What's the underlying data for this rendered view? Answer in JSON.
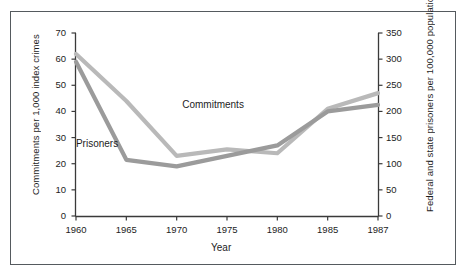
{
  "figure": {
    "background": "#ffffff",
    "frame_color": "#555a5e"
  },
  "chart_data": {
    "type": "line",
    "title": "",
    "xlabel": "Year",
    "ylabel": "Commitments per 1,000 index crimes",
    "y2label": "Federal and state prisoners per 100,000 population",
    "x": [
      1960,
      1965,
      1970,
      1975,
      1980,
      1985,
      1987
    ],
    "xtick_labels": [
      "1960",
      "1965",
      "1970",
      "1975",
      "1980",
      "1985",
      "1987"
    ],
    "ylim": [
      0,
      70
    ],
    "ytick_labels": [
      "0",
      "10",
      "20",
      "30",
      "40",
      "50",
      "60",
      "70"
    ],
    "ytick_values": [
      0,
      10,
      20,
      30,
      40,
      50,
      60,
      70
    ],
    "y2lim": [
      0,
      350
    ],
    "y2tick_labels": [
      "0",
      "50",
      "100",
      "150",
      "200",
      "250",
      "300",
      "350"
    ],
    "y2tick_values": [
      0,
      50,
      100,
      150,
      200,
      250,
      300,
      350
    ],
    "grid": false,
    "legend_position": "inline-annotations",
    "series": [
      {
        "name": "Commitments",
        "axis": "left",
        "color": "#b9b9b9",
        "units": "commitments per 1,000 index crimes",
        "values": [
          62,
          44,
          23,
          25.5,
          24,
          41,
          47
        ]
      },
      {
        "name": "Prisoners",
        "axis": "right",
        "color": "#9b9b9b",
        "units": "prisoners per 100,000 population",
        "values_left_scale": [
          59,
          21.5,
          19,
          23,
          27,
          40,
          42.5
        ],
        "values": [
          295,
          108,
          95,
          115,
          135,
          200,
          213
        ]
      }
    ],
    "annotations": [
      {
        "text": "Commitments",
        "x": 1972,
        "y": 42
      },
      {
        "text": "Prisoners",
        "x": 1962.5,
        "y": 27
      }
    ]
  }
}
